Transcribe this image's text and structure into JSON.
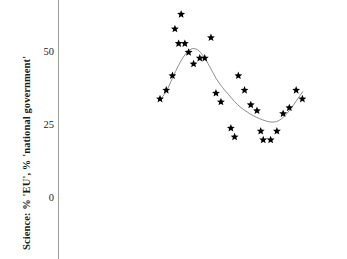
{
  "figure": {
    "background_color": "#ffffff",
    "axis_color": "#9a9a9a",
    "marker_color": "#000000",
    "trend_color": "#808080"
  },
  "axis": {
    "y_title": "Science: % 'EU', % 'national government'",
    "y_ticks": [
      {
        "label": "50",
        "value": 50
      },
      {
        "label": "25",
        "value": 25
      },
      {
        "label": "0",
        "value": 0
      }
    ]
  },
  "chart_data": {
    "type": "scatter",
    "title": "",
    "xlabel": "",
    "ylabel": "Science: % 'EU', % 'national government'",
    "ylim": [
      0,
      68
    ],
    "xlim": [
      0,
      30
    ],
    "grid": false,
    "legend": "none",
    "marker": "star",
    "series": [
      {
        "name": "Science: % 'EU', % 'national government'",
        "x": [
          1,
          2,
          3,
          3.4,
          4,
          4.4,
          5,
          5.6,
          6.4,
          7.4,
          8.2,
          9.2,
          10,
          10.8,
          12.4,
          13,
          13.6,
          14.6,
          15.6,
          16.6,
          17.2,
          17.6,
          18.8,
          19.8,
          20.8,
          21.8,
          22.9,
          23.9
        ],
        "values": [
          34,
          37,
          42,
          58,
          53,
          63,
          53,
          50,
          46,
          48,
          48,
          55,
          36,
          33,
          24,
          21,
          42,
          37,
          32,
          30,
          23,
          20,
          20,
          23,
          29,
          31,
          37,
          34
        ]
      }
    ],
    "trend_line": {
      "description": "smoothed fit through scatter: rises to ~51 peak near x=6, falls to ~26 trough near x=20, rises again to ~37",
      "x": [
        1,
        2,
        3,
        4,
        5,
        6,
        7,
        8,
        9,
        10,
        11,
        12,
        13,
        14,
        15,
        16,
        17,
        18,
        19,
        20,
        21,
        22,
        23,
        24
      ],
      "values": [
        33.5,
        36.5,
        41.0,
        45.5,
        49.0,
        51.0,
        50.8,
        48.5,
        45.0,
        41.0,
        38.0,
        35.5,
        33.0,
        31.0,
        29.5,
        28.2,
        27.2,
        26.4,
        26.0,
        26.4,
        28.0,
        30.5,
        33.5,
        36.5
      ]
    }
  }
}
